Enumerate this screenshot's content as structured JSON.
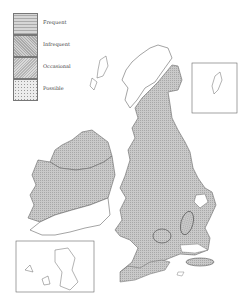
{
  "legend": {
    "items": [
      {
        "label": "Frequent",
        "pattern": "horizontal-lines",
        "color": "#b8b8b8"
      },
      {
        "label": "Infrequent",
        "pattern": "cross-hatch",
        "color": "#c4c4c4"
      },
      {
        "label": "Occasional",
        "pattern": "cross-hatch",
        "color": "#cfcfcf"
      },
      {
        "label": "Possible",
        "pattern": "stipple",
        "color": "#e6e6e6"
      }
    ]
  },
  "map": {
    "region": "British Isles",
    "insets": [
      "Shetland Islands",
      "Channel Islands"
    ],
    "colors": {
      "shaded": "#c8c8c8",
      "outline": "#666666",
      "unshaded": "#ffffff"
    }
  }
}
